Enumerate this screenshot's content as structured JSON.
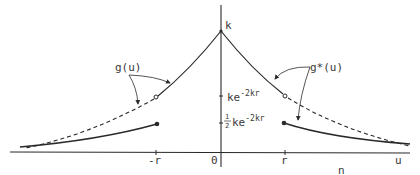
{
  "diagram": {
    "type": "function-plot",
    "axes": {
      "vertical_peak_label": "k",
      "horizontal_label": "n",
      "x_ticks": {
        "neg_r": "-r",
        "zero": "0",
        "r": "r",
        "u": "u"
      },
      "y_ticks": {
        "ke": "ke",
        "ke_exp": "-2kr",
        "half": "1",
        "half_den": "2",
        "half_ke": "ke",
        "half_ke_exp": "-2kr"
      }
    },
    "curves": {
      "left": {
        "label": "g(u)",
        "description": "solid curve from peak to open circle at -r, dashed continuation, filled dot at -r with lower solid branch"
      },
      "right": {
        "label": "g*(u)",
        "description": "solid curve from peak to open circle at r, dashed continuation, filled dot at r with lower solid branch"
      }
    },
    "colors": {
      "ink": "#2a2a2a",
      "background": "#ffffff"
    }
  }
}
